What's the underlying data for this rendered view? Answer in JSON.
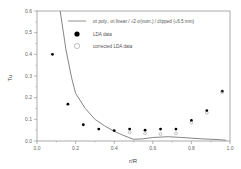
{
  "chart_data": {
    "type": "scatter",
    "title": "",
    "xlabel": "r/R",
    "ylabel": "Tu",
    "xlim": [
      0.0,
      1.0
    ],
    "ylim": [
      0.0,
      0.6
    ],
    "xticks": [
      "0.0",
      "0.2",
      "0.4",
      "0.6",
      "0.8",
      "1.0"
    ],
    "yticks": [
      "0.0",
      "0.1",
      "0.2",
      "0.3",
      "0.4",
      "0.5",
      "0.6"
    ],
    "grid": false,
    "legend_position": "upper right",
    "series": [
      {
        "name": "σt poly., σt linear / √2·σ(num.) / clipped (≤6.5 mm)",
        "kind": "line",
        "color": "#777777",
        "x": [
          0.12,
          0.15,
          0.18,
          0.2,
          0.25,
          0.3,
          0.35,
          0.4,
          0.45,
          0.5,
          0.55,
          0.6,
          0.68,
          0.75,
          0.85,
          0.95,
          0.98
        ],
        "values": [
          0.6,
          0.42,
          0.29,
          0.22,
          0.15,
          0.1,
          0.07,
          0.045,
          0.025,
          0.008,
          0.01,
          0.016,
          0.02,
          0.016,
          0.01,
          0.006,
          0.003
        ]
      },
      {
        "name": "LDA data",
        "kind": "scatter",
        "marker": "filled-circle",
        "color": "#000000",
        "x": [
          0.08,
          0.16,
          0.24,
          0.32,
          0.4,
          0.48,
          0.56,
          0.64,
          0.72,
          0.8,
          0.88,
          0.96
        ],
        "values": [
          0.4,
          0.17,
          0.075,
          0.055,
          0.048,
          0.055,
          0.05,
          0.055,
          0.055,
          0.095,
          0.14,
          0.23
        ]
      },
      {
        "name": "corrected LDA data",
        "kind": "scatter",
        "marker": "open-circle",
        "color": "#888888",
        "x": [
          0.48,
          0.56,
          0.64,
          0.72,
          0.8,
          0.88,
          0.96
        ],
        "values": [
          0.04,
          0.035,
          0.032,
          0.035,
          0.085,
          0.13,
          0.225
        ]
      }
    ]
  },
  "legend": {
    "line_label": "σt poly., σt linear / √2·σ(num.) / clipped (≤6.5 mm)",
    "filled_label": "LDA data",
    "open_label": "corrected LDA data"
  },
  "axes": {
    "xlabel": "r/R",
    "ylabel": "Tu"
  }
}
